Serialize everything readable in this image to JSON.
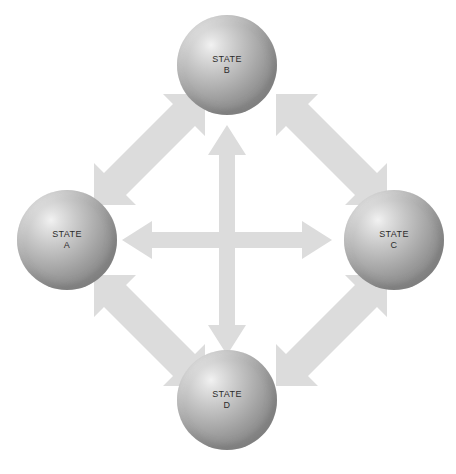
{
  "diagram": {
    "background_color": "#ffffff",
    "arrow_color": "#dcdcdc",
    "label_color": "#2b2b2b",
    "nodes": [
      {
        "id": "a",
        "name": "STATE A",
        "line1": "STATE",
        "line2": "A",
        "cx": 67,
        "cy": 240,
        "r": 50
      },
      {
        "id": "b",
        "name": "STATE B",
        "line1": "STATE",
        "line2": "B",
        "cx": 227,
        "cy": 65,
        "r": 50
      },
      {
        "id": "c",
        "name": "STATE C",
        "line1": "STATE",
        "line2": "C",
        "cx": 394,
        "cy": 240,
        "r": 50
      },
      {
        "id": "d",
        "name": "STATE D",
        "line1": "STATE",
        "line2": "D",
        "cx": 227,
        "cy": 400,
        "r": 50
      }
    ],
    "connectors": [
      {
        "id": "b-d",
        "from": "STATE B",
        "to": "STATE D",
        "orientation": "vertical",
        "double_headed": true
      },
      {
        "id": "a-c",
        "from": "STATE A",
        "to": "STATE C",
        "orientation": "horizontal",
        "double_headed": true
      },
      {
        "id": "a-b",
        "from": "STATE A",
        "to": "STATE B",
        "orientation": "diagonal-up-right",
        "double_headed": true
      },
      {
        "id": "b-c",
        "from": "STATE B",
        "to": "STATE C",
        "orientation": "diagonal-down-right",
        "double_headed": true
      },
      {
        "id": "a-d",
        "from": "STATE A",
        "to": "STATE D",
        "orientation": "diagonal-down-right",
        "double_headed": true
      },
      {
        "id": "d-c",
        "from": "STATE D",
        "to": "STATE C",
        "orientation": "diagonal-up-right",
        "double_headed": true
      }
    ]
  }
}
